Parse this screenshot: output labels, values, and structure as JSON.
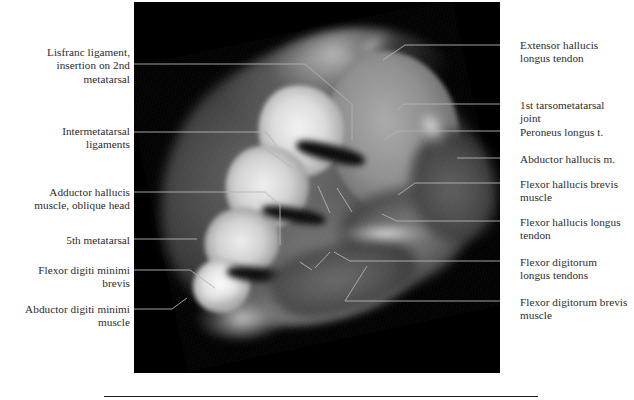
{
  "figure": {
    "type": "anatomical-mri-cross-section",
    "region": "foot, axial MRI section through the tarsometatarsal (Lisfranc) level",
    "plate_background": "#000000",
    "label_color": "#2b2b2b",
    "leader_color": "#b3b3b3",
    "image_rect": {
      "x": 134,
      "y": 2,
      "width": 366,
      "height": 371
    }
  },
  "labels_left": [
    {
      "id": "lisfranc-ligament",
      "text": "Lisfranc ligament,\ninsertion on 2nd\nmetatarsal",
      "x": 18,
      "y": 46,
      "width": 112,
      "leader": "134,64 305,64 352,104"
    },
    {
      "id": "intermetatarsal-ligaments",
      "text": "Intermetatarsal\nligaments",
      "x": 31,
      "y": 125,
      "width": 99,
      "leader": "134,132 266,132 277,146"
    },
    {
      "id": "adductor-hallucis-oblique-head",
      "text": "Adductor hallucis\nmuscle, oblique head",
      "x": 12,
      "y": 186,
      "width": 118,
      "leader": "134,192 265,192 280,205"
    },
    {
      "id": "fifth-metatarsal",
      "text": "5th metatarsal",
      "x": 42,
      "y": 234,
      "width": 88,
      "leader": "134,239 197,239"
    },
    {
      "id": "flexor-digiti-minimi-brevis",
      "text": "Flexor digiti minimi\nbrevis",
      "x": 14,
      "y": 264,
      "width": 116,
      "leader": "134,270 190,270 215,288"
    },
    {
      "id": "abductor-digiti-minimi-muscle",
      "text": "Abductor digiti minimi\nmuscle",
      "x": 0,
      "y": 303,
      "width": 130,
      "leader": "134,309 172,309 187,298"
    }
  ],
  "labels_right": [
    {
      "id": "extensor-hallucis-longus-tendon",
      "text": "Extensor hallucis\nlongus tendon",
      "x": 520,
      "y": 39,
      "width": 112,
      "leader": "500,45 405,45 383,60"
    },
    {
      "id": "first-tarsometatarsal-joint",
      "text": "1st tarsometatarsal\njoint",
      "x": 520,
      "y": 99,
      "width": 112,
      "leader": "500,104 404,104 398,110"
    },
    {
      "id": "peroneus-longus-tendon",
      "text": "Peroneus longus t.",
      "x": 520,
      "y": 126,
      "width": 112,
      "leader": "500,131 398,131 385,139"
    },
    {
      "id": "abductor-hallucis-muscle",
      "text": "Abductor hallucis m.",
      "x": 520,
      "y": 153,
      "width": 112,
      "leader": "500,158 457,158"
    },
    {
      "id": "flexor-hallucis-brevis-muscle",
      "text": "Flexor hallucis brevis\nmuscle",
      "x": 520,
      "y": 178,
      "width": 112,
      "leader": "500,183 415,183 398,195"
    },
    {
      "id": "flexor-hallucis-longus-tendon",
      "text": "Flexor hallucis longus\ntendon",
      "x": 520,
      "y": 216,
      "width": 112,
      "leader": "500,221 397,221 382,214"
    },
    {
      "id": "flexor-digitorum-longus-tendons",
      "text": "Flexor digitorum\nlongus tendons",
      "x": 520,
      "y": 256,
      "width": 112,
      "leader": "500,261 350,261 334,252"
    },
    {
      "id": "flexor-digitorum-brevis-muscle",
      "text": "Flexor digitorum brevis\nmuscle",
      "x": 520,
      "y": 296,
      "width": 114,
      "leader": "500,301 345,301 367,266"
    }
  ],
  "extra_leaders": [
    "352,104 352,140",
    "318,186 330,213",
    "337,188 352,212",
    "280,205 280,245",
    "262,146 292,168",
    "330,252 315,268",
    "300,262 312,270"
  ]
}
